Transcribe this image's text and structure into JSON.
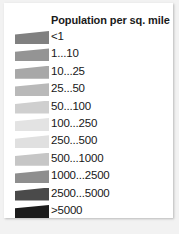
{
  "legend": {
    "title": "Population per sq. mile"
  },
  "chart_data": {
    "type": "legend",
    "title": "Population per sq. mile",
    "xlabel": "",
    "ylabel": "",
    "units": "people per square mile",
    "grid": false,
    "legend_position": "standalone",
    "categories": [
      "<1",
      "1...10",
      "10...25",
      "25...50",
      "50...100",
      "100...250",
      "250...500",
      "500...1000",
      "1000...2500",
      "2500...5000",
      ">5000"
    ],
    "colors": [
      "#808080",
      "#949494",
      "#a8a8a8",
      "#b9b9b9",
      "#cfcfcf",
      "#e3e3e3",
      "#e0e0e0",
      "#c6c6c6",
      "#8e8e8e",
      "#4a4a4a",
      "#1c1c1c"
    ],
    "bins": [
      {
        "label": "<1",
        "color": "#808080",
        "min": 0,
        "max": 1
      },
      {
        "label": "1...10",
        "color": "#949494",
        "min": 1,
        "max": 10
      },
      {
        "label": "10...25",
        "color": "#a8a8a8",
        "min": 10,
        "max": 25
      },
      {
        "label": "25...50",
        "color": "#b9b9b9",
        "min": 25,
        "max": 50
      },
      {
        "label": "50...100",
        "color": "#cfcfcf",
        "min": 50,
        "max": 100
      },
      {
        "label": "100...250",
        "color": "#e3e3e3",
        "min": 100,
        "max": 250
      },
      {
        "label": "250...500",
        "color": "#e0e0e0",
        "min": 250,
        "max": 500
      },
      {
        "label": "500...1000",
        "color": "#c6c6c6",
        "min": 500,
        "max": 1000
      },
      {
        "label": "1000...2500",
        "color": "#8e8e8e",
        "min": 1000,
        "max": 2500
      },
      {
        "label": "2500...5000",
        "color": "#4a4a4a",
        "min": 2500,
        "max": 5000
      },
      {
        "label": ">5000",
        "color": "#1c1c1c",
        "min": 5000,
        "max": null
      }
    ]
  }
}
